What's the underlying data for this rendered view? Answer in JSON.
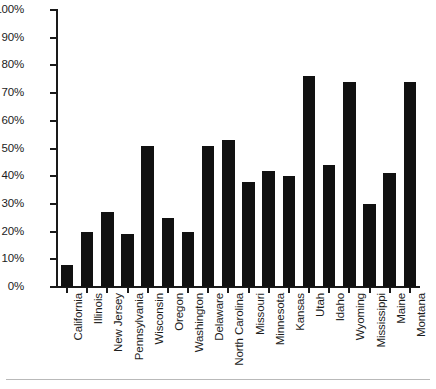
{
  "chart_data": {
    "type": "bar",
    "title": "",
    "subtitle": "",
    "xlabel": "",
    "ylabel": "",
    "ylim": [
      0,
      100
    ],
    "grid": false,
    "legend": "none",
    "value_suffix": "%",
    "y_ticks": [
      "0%",
      "10%",
      "20%",
      "30%",
      "40%",
      "50%",
      "60%",
      "70%",
      "80%",
      "90%",
      "100%"
    ],
    "y_tick_values": [
      0,
      10,
      20,
      30,
      40,
      50,
      60,
      70,
      80,
      90,
      100
    ],
    "bar_color": "#111111",
    "axis_color": "#1a1a1a",
    "background_color": "#ffffff",
    "categories": [
      "California",
      "Illinois",
      "New Jersey",
      "Pennsylvania",
      "Wisconsin",
      "Oregon",
      "Washington",
      "Delaware",
      "North Carolina",
      "Missouri",
      "Minnesota",
      "Kansas",
      "Utah",
      "Idaho",
      "Wyoming",
      "Mississippi",
      "Maine",
      "Montana"
    ],
    "values": [
      8,
      20,
      27,
      19,
      51,
      25,
      20,
      51,
      53,
      38,
      42,
      40,
      76,
      44,
      74,
      30,
      41,
      74
    ]
  }
}
